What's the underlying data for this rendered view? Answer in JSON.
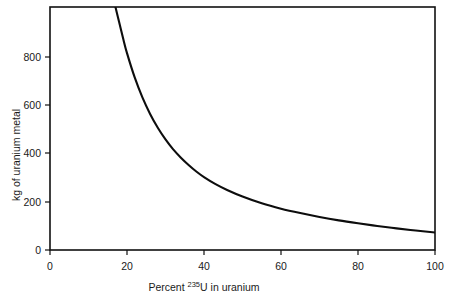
{
  "figure": {
    "background_color": "#ffffff",
    "ink_color": "#111111",
    "curve_color": "#0d0d0d"
  },
  "chart_data": {
    "type": "line",
    "title": "",
    "subtitle": "",
    "xlabel_parts": {
      "prefix": "Percent ",
      "superscript": "235",
      "suffix": "U in uranium"
    },
    "xlabel": "Percent 235U in uranium",
    "ylabel": "kg of uranium metal",
    "xlim": [
      0,
      100
    ],
    "ylim": [
      0,
      1000
    ],
    "xticks": [
      0,
      20,
      40,
      60,
      80,
      100
    ],
    "xtick_labels": [
      "0",
      "20",
      "40",
      "60",
      "80",
      "100"
    ],
    "yticks": [
      0,
      200,
      400,
      600,
      800
    ],
    "ytick_labels": [
      "0",
      "200",
      "400",
      "600",
      "800"
    ],
    "grid": false,
    "legend": null,
    "legend_position": "none",
    "series": [
      {
        "name": "kg of uranium metal vs percent U-235",
        "x": [
          17,
          18,
          19,
          20,
          22,
          24,
          26,
          28,
          30,
          32,
          34,
          36,
          38,
          40,
          43,
          46,
          50,
          55,
          60,
          65,
          70,
          75,
          80,
          85,
          90,
          95,
          100
        ],
        "y": [
          1000,
          935,
          870,
          810,
          710,
          628,
          560,
          503,
          455,
          414,
          380,
          350,
          323,
          300,
          271,
          247,
          220,
          192,
          170,
          152,
          136,
          122,
          110,
          99,
          89,
          80,
          72
        ],
        "clipped_top": true,
        "enters_top_at_x": 17
      }
    ]
  },
  "axes": {
    "left_spine_visible": true,
    "bottom_spine_visible": true,
    "top_spine_visible": true,
    "right_spine_visible": true
  }
}
